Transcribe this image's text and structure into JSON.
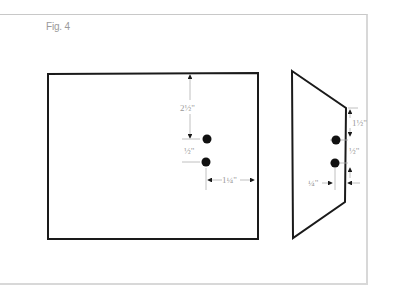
{
  "figure": {
    "label": "Fig. 4",
    "front_view": {
      "shape": "rectangle",
      "dimensions": {
        "top_to_upper_hole": "2½\"",
        "hole_spacing": "½\"",
        "hole_to_right_edge": "1¼\""
      }
    },
    "side_view": {
      "shape": "trapezoid",
      "dimensions": {
        "top_edge_to_upper_hole": "1½\"",
        "hole_spacing": "½\"",
        "hole_to_edge": "¼\""
      }
    },
    "colors": {
      "outline": "#1a1a1a",
      "dimension": "#9a9a9a",
      "frame": "#d8d8d8"
    }
  }
}
